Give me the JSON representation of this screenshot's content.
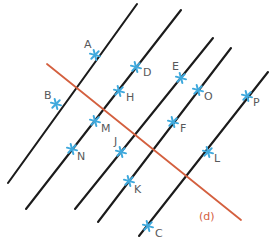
{
  "figure": {
    "width": 278,
    "height": 242,
    "background": "#ffffff",
    "colors": {
      "parallel_line": "#1b1b1b",
      "transversal_line": "#d4603f",
      "point_marker": "#3fa9dd",
      "point_label": "#58595b",
      "line_label": "#d4603f"
    },
    "parallel_lines": [
      {
        "name": "line-1",
        "x1": 8,
        "y1": 183,
        "x2": 137,
        "y2": 4
      },
      {
        "name": "line-2",
        "x1": 26,
        "y1": 209,
        "x2": 181,
        "y2": 10
      },
      {
        "name": "line-3",
        "x1": 75,
        "y1": 209,
        "x2": 213,
        "y2": 38
      },
      {
        "name": "line-4",
        "x1": 98,
        "y1": 222,
        "x2": 231,
        "y2": 48
      },
      {
        "name": "line-5",
        "x1": 139,
        "y1": 236,
        "x2": 268,
        "y2": 72
      }
    ],
    "transversal": {
      "name": "line-d",
      "x1": 47,
      "y1": 64,
      "x2": 241,
      "y2": 220,
      "label": "(d)",
      "label_x": 199,
      "label_y": 220
    },
    "points": [
      {
        "label": "A",
        "x": 95,
        "y": 55,
        "lx": 84,
        "ly": 48
      },
      {
        "label": "B",
        "x": 56,
        "y": 104,
        "lx": 44,
        "ly": 99
      },
      {
        "label": "C",
        "x": 148,
        "y": 226,
        "lx": 155,
        "ly": 237
      },
      {
        "label": "D",
        "x": 136,
        "y": 67,
        "lx": 143,
        "ly": 76
      },
      {
        "label": "E",
        "x": 181,
        "y": 78,
        "lx": 172,
        "ly": 70
      },
      {
        "label": "F",
        "x": 173,
        "y": 122,
        "lx": 180,
        "ly": 132
      },
      {
        "label": "H",
        "x": 119,
        "y": 91,
        "lx": 126,
        "ly": 101
      },
      {
        "label": "J",
        "x": 121,
        "y": 152,
        "lx": 114,
        "ly": 145
      },
      {
        "label": "K",
        "x": 129,
        "y": 181,
        "lx": 134,
        "ly": 193
      },
      {
        "label": "L",
        "x": 208,
        "y": 152,
        "lx": 214,
        "ly": 162
      },
      {
        "label": "M",
        "x": 95,
        "y": 121,
        "lx": 101,
        "ly": 132
      },
      {
        "label": "N",
        "x": 72,
        "y": 149,
        "lx": 77,
        "ly": 160
      },
      {
        "label": "O",
        "x": 198,
        "y": 90,
        "lx": 204,
        "ly": 100
      },
      {
        "label": "P",
        "x": 247,
        "y": 96,
        "lx": 253,
        "ly": 106
      }
    ]
  }
}
